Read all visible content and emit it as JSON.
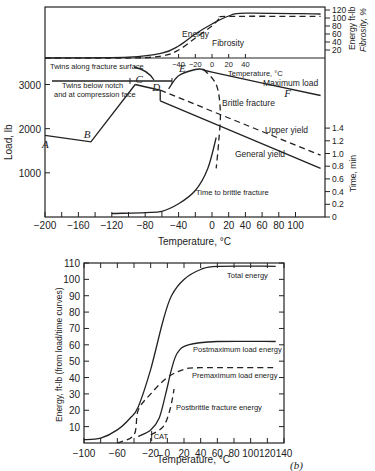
{
  "chart_data": [
    {
      "id": "a",
      "type": "line",
      "title": "",
      "xlabel": "Temperature, °C",
      "ylabel": "Load, lb",
      "xlim": [
        -200,
        130
      ],
      "ylim": [
        0,
        3600
      ],
      "x_ticks": [
        -200,
        -160,
        -120,
        -80,
        -40,
        0,
        20,
        40,
        60,
        80,
        100
      ],
      "y_ticks": [
        1000,
        2000,
        3000
      ],
      "y2label": "Time, min",
      "y2_ticks": [
        "0",
        "0.2",
        "0.4",
        "0.6",
        "0.8",
        "1.0",
        "1.2",
        "1.4"
      ],
      "series": [
        {
          "name": "Load (A-B-C)",
          "style": "solid",
          "points": [
            [
              -200,
              1850
            ],
            [
              -145,
              1700
            ],
            [
              -92,
              3000
            ]
          ]
        },
        {
          "name": "Maximum load",
          "style": "solid",
          "points": [
            [
              -52,
              2900
            ],
            [
              -40,
              3200
            ],
            [
              -20,
              3340
            ],
            [
              -10,
              3340
            ],
            [
              0,
              3280
            ],
            [
              130,
              2750
            ]
          ]
        },
        {
          "name": "Upper yield",
          "style": "dashed",
          "points": [
            [
              -62,
              2870
            ],
            [
              130,
              1400
            ]
          ]
        },
        {
          "name": "General yield",
          "style": "solid",
          "points": [
            [
              -62,
              2630
            ],
            [
              130,
              1100
            ]
          ]
        },
        {
          "name": "Brittle fracture",
          "style": "dashed",
          "points": [
            [
              -10,
              3340
            ],
            [
              5,
              3000
            ],
            [
              10,
              2400
            ],
            [
              8,
              1700
            ],
            [
              5,
              1100
            ]
          ]
        },
        {
          "name": "Time to brittle fracture",
          "style": "solid",
          "points": [
            [
              -120,
              80
            ],
            [
              -80,
              100
            ],
            [
              -60,
              130
            ],
            [
              -40,
              300
            ],
            [
              -20,
              600
            ],
            [
              -5,
              1100
            ],
            [
              5,
              1800
            ]
          ]
        }
      ],
      "points_labels": [
        {
          "label": "A",
          "x": -200,
          "y": 1650
        },
        {
          "label": "B",
          "x": -150,
          "y": 1880
        },
        {
          "label": "C",
          "x": -88,
          "y": 3120
        },
        {
          "label": "D",
          "x": -68,
          "y": 2950
        },
        {
          "label": "E",
          "x": -36,
          "y": 3370
        },
        {
          "label": "F",
          "x": 90,
          "y": 2800
        }
      ],
      "annotations": [
        "Twins along fracture surface",
        "Twins below notch and at compression face",
        "Maximum load",
        "Brittle fracture",
        "Upper yield",
        "General yield",
        "Time to brittle fracture"
      ],
      "inset": {
        "type": "line",
        "xlabel": "Temperature, °C",
        "x_ticks": [
          -40,
          -20,
          0,
          20,
          40
        ],
        "ylabel": "Energy ft-lb / Fibrosity, %",
        "y_ticks": [
          20,
          40,
          60,
          80,
          100,
          120
        ],
        "series": [
          {
            "name": "Energy",
            "style": "solid",
            "points": [
              [
                -200,
                0
              ],
              [
                -100,
                2
              ],
              [
                -60,
                12
              ],
              [
                -40,
                30
              ],
              [
                -20,
                60
              ],
              [
                0,
                85
              ],
              [
                20,
                105
              ],
              [
                40,
                112
              ],
              [
                130,
                110
              ]
            ]
          },
          {
            "name": "Fibrosity",
            "style": "dashed",
            "points": [
              [
                -200,
                0
              ],
              [
                -100,
                0
              ],
              [
                -60,
                5
              ],
              [
                -40,
                20
              ],
              [
                -20,
                50
              ],
              [
                0,
                80
              ],
              [
                10,
                100
              ],
              [
                20,
                104
              ],
              [
                130,
                104
              ]
            ]
          }
        ]
      }
    },
    {
      "id": "b",
      "type": "line",
      "title": "",
      "xlabel": "Temperature, °C",
      "ylabel": "Energy, ft-lb (from load/time curves)",
      "xlim": [
        -100,
        140
      ],
      "ylim": [
        0,
        110
      ],
      "x_ticks": [
        -100,
        -60,
        -20,
        0,
        20,
        40,
        60,
        80,
        100,
        120,
        140
      ],
      "y_ticks": [
        10,
        20,
        30,
        40,
        50,
        60,
        70,
        80,
        90,
        100,
        110
      ],
      "series": [
        {
          "name": "Total energy",
          "style": "solid",
          "points": [
            [
              -100,
              2
            ],
            [
              -80,
              3
            ],
            [
              -60,
              8
            ],
            [
              -45,
              15
            ],
            [
              -35,
              22
            ],
            [
              -20,
              45
            ],
            [
              -5,
              75
            ],
            [
              5,
              90
            ],
            [
              20,
              100
            ],
            [
              40,
              106
            ],
            [
              60,
              108
            ],
            [
              130,
              108
            ]
          ]
        },
        {
          "name": "Postmaximum load energy",
          "style": "solid",
          "points": [
            [
              -35,
              4
            ],
            [
              -20,
              8
            ],
            [
              -10,
              15
            ],
            [
              -2,
              30
            ],
            [
              5,
              45
            ],
            [
              12,
              55
            ],
            [
              25,
              60
            ],
            [
              60,
              62
            ],
            [
              130,
              62
            ]
          ]
        },
        {
          "name": "Premaximum load energy",
          "style": "dashed",
          "points": [
            [
              -60,
              0
            ],
            [
              -40,
              5
            ],
            [
              -35,
              20
            ],
            [
              -20,
              30
            ],
            [
              0,
              40
            ],
            [
              20,
              45
            ],
            [
              40,
              46
            ],
            [
              130,
              46
            ]
          ]
        },
        {
          "name": "Postbrittle fracture energy",
          "style": "dashed",
          "points": [
            [
              -20,
              5
            ],
            [
              -5,
              10
            ],
            [
              3,
              20
            ],
            [
              7,
              30
            ],
            [
              8,
              33
            ]
          ]
        }
      ],
      "annotations": [
        "Total energy",
        "Postmaximum load energy",
        "Premaximum load energy",
        "Postbrittle fracture energy",
        "CAT"
      ],
      "panel_label": "(b)"
    }
  ],
  "labels": {
    "a": {
      "xlabel": "Temperature, °C",
      "ylabel": "Load, lb",
      "y2_time": "Time, min",
      "y2_energy": "Energy ft-lb",
      "y2_fibrosity": "Fibrosity, %",
      "inset_xlabel": "Temperature, °C",
      "twins_along": "Twins along fracture surface",
      "twins_below_1": "Twins below notch",
      "twins_below_2": "and at compression face",
      "energy": "Energy",
      "fibrosity": "Fibrosity",
      "max_load": "Maximum load",
      "brittle": "Brittle fracture",
      "upper_yield": "Upper yield",
      "general_yield": "General yield",
      "time_brittle": "Time to brittle fracture"
    },
    "b": {
      "xlabel": "Temperature, °C",
      "ylabel": "Energy, ft-lb (from load/time curves)",
      "total": "Total energy",
      "postmax": "Postmaximum load energy",
      "premax": "Premaximum load energy",
      "postbrittle": "Postbrittle fracture energy",
      "cat": "CAT",
      "panel": "(b)"
    }
  }
}
